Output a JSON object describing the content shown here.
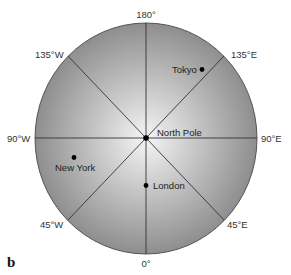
{
  "diagram": {
    "panel_label": "b",
    "center": {
      "label": "North Pole",
      "x": 146,
      "y": 138
    },
    "globe": {
      "rx": 111,
      "ry": 115,
      "fill_center": "#f4f4f4",
      "fill_edge": "#8f8f8f"
    },
    "meridians": [
      {
        "label": "180°",
        "angle_deg": 180
      },
      {
        "label": "135°E",
        "angle_deg": 135
      },
      {
        "label": "90°E",
        "angle_deg": 90
      },
      {
        "label": "45°E",
        "angle_deg": 45
      },
      {
        "label": "0°",
        "angle_deg": 0
      },
      {
        "label": "45°W",
        "angle_deg": -45
      },
      {
        "label": "90°W",
        "angle_deg": -90
      },
      {
        "label": "135°W",
        "angle_deg": -135
      }
    ],
    "cities": [
      {
        "name": "Tokyo",
        "x": 202,
        "y": 69
      },
      {
        "name": "New York",
        "x": 74,
        "y": 157
      },
      {
        "name": "London",
        "x": 146,
        "y": 185
      }
    ]
  }
}
